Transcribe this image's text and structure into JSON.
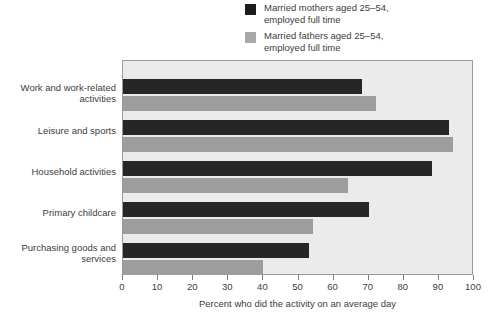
{
  "chart_data": {
    "type": "bar",
    "orientation": "horizontal",
    "title": "",
    "xlabel": "Percent who did the activity on an average day",
    "ylabel": "",
    "xlim": [
      0,
      100
    ],
    "xticks": [
      0,
      10,
      20,
      30,
      40,
      50,
      60,
      70,
      80,
      90,
      100
    ],
    "grid": false,
    "legend_position": "top-right",
    "categories": [
      "Work and work-related\nactivities",
      "Leisure and sports",
      "Household activities",
      "Primary childcare",
      "Purchasing goods and\nservices"
    ],
    "series": [
      {
        "name": "Married mothers aged 25–54,\nemployed full time",
        "color": "#262626",
        "values": [
          68,
          93,
          88,
          70,
          53
        ]
      },
      {
        "name": "Married fathers aged 25–54,\nemployed full time",
        "color": "#9d9d9d",
        "values": [
          72,
          94,
          64,
          54,
          40
        ]
      }
    ]
  },
  "legend": {
    "items": [
      {
        "label": "Married mothers aged 25–54,\nemployed full time",
        "swatch": "legend-swatch-mothers"
      },
      {
        "label": "Married fathers aged 25–54,\nemployed full time",
        "swatch": "legend-swatch-fathers"
      }
    ]
  },
  "axis": {
    "tick_labels": [
      "0",
      "10",
      "20",
      "30",
      "40",
      "50",
      "60",
      "70",
      "80",
      "90",
      "100"
    ],
    "title": "Percent who did the activity on an average day"
  },
  "categories_labels": [
    "Work and work-related\nactivities",
    "Leisure and sports",
    "Household activities",
    "Primary childcare",
    "Purchasing goods and\nservices"
  ],
  "colors": {
    "mothers": "#262626",
    "fathers": "#9d9d9d",
    "plot_background": "#ebebeb",
    "frame": "#9a9a9a",
    "text": "#3d3d3d"
  }
}
